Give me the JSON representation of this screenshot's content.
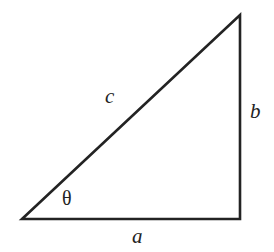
{
  "figure": {
    "kind": "right-triangle-diagram",
    "background_color": "#ffffff",
    "stroke_color": "#232323",
    "stroke_width": 2.6,
    "text_color": "#232323",
    "labels": {
      "hypotenuse": "c",
      "vertical_leg": "b",
      "horizontal_leg": "a",
      "angle": "θ"
    },
    "geometry": {
      "vertex_bottom_left": [
        22,
        219
      ],
      "vertex_bottom_right": [
        240,
        219
      ],
      "vertex_top_right": [
        240,
        15
      ],
      "polyline_points": "22,219 240,219 240,15 22,219"
    }
  }
}
